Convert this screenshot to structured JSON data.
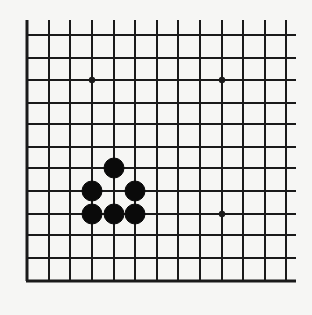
{
  "diagram": {
    "type": "go-board-excerpt",
    "background": "#f6f6f4",
    "line_color": "#1a1a1a",
    "stone_color": "#0a0a0a",
    "grid": {
      "columns_x": [
        27,
        49,
        70,
        92,
        114,
        135,
        157,
        178,
        200,
        222,
        243,
        265,
        286
      ],
      "rows_y": [
        35,
        58,
        80,
        103,
        124,
        147,
        168,
        191,
        214,
        235,
        258,
        281
      ],
      "vertical_top": 20,
      "horizontal_right": 296,
      "edges": {
        "left": true,
        "bottom": true,
        "top": false,
        "right": false
      }
    },
    "star_points": [
      {
        "col": 3,
        "row": 2
      },
      {
        "col": 9,
        "row": 2
      },
      {
        "col": 9,
        "row": 8
      }
    ],
    "stones": [
      {
        "color": "black",
        "col": 4,
        "row": 6
      },
      {
        "color": "black",
        "col": 3,
        "row": 7
      },
      {
        "color": "black",
        "col": 5,
        "row": 7
      },
      {
        "color": "black",
        "col": 3,
        "row": 8
      },
      {
        "color": "black",
        "col": 4,
        "row": 8
      },
      {
        "color": "black",
        "col": 5,
        "row": 8
      }
    ]
  }
}
